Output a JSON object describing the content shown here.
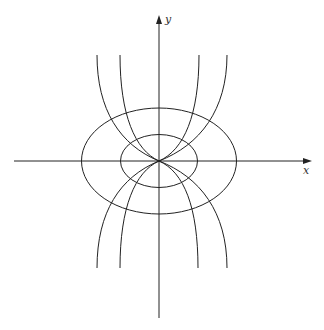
{
  "diagram": {
    "axes": {
      "x_label": "x",
      "y_label": "y",
      "origin": [
        159,
        161
      ]
    },
    "ellipses": [
      {
        "name": "outer-ellipse",
        "cx": 159,
        "cy": 161,
        "rx": 77.5,
        "ry": 53
      },
      {
        "name": "inner-ellipse",
        "cx": 159,
        "cy": 161,
        "rx": 38.5,
        "ry": 26.5
      }
    ],
    "curves": [
      {
        "name": "outer-left-curve",
        "top_x": 97,
        "bottom_x": 97
      },
      {
        "name": "inner-left-curve",
        "top_x": 120,
        "bottom_x": 120
      },
      {
        "name": "inner-right-curve",
        "top_x": 199,
        "bottom_x": 198
      },
      {
        "name": "outer-right-curve",
        "top_x": 227,
        "bottom_x": 227
      }
    ],
    "stroke_color": "#222222"
  }
}
